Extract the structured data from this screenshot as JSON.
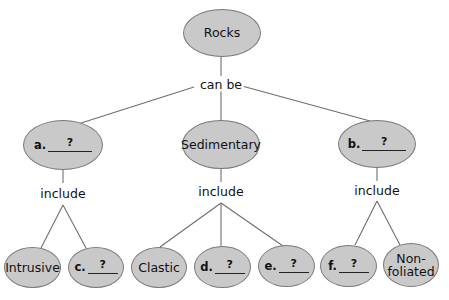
{
  "diagram": {
    "type": "concept-map",
    "root": {
      "label": "Rocks"
    },
    "root_link": "can be",
    "categories": [
      {
        "id": "a",
        "letter": "a.",
        "blank": "?",
        "link": "include",
        "children": [
          {
            "label": "Intrusive"
          },
          {
            "letter": "c.",
            "blank": "?"
          }
        ]
      },
      {
        "id": "sedimentary",
        "label": "Sedimentary",
        "link": "include",
        "children": [
          {
            "label": "Clastic"
          },
          {
            "letter": "d.",
            "blank": "?"
          },
          {
            "letter": "e.",
            "blank": "?"
          }
        ]
      },
      {
        "id": "b",
        "letter": "b.",
        "blank": "?",
        "link": "include",
        "children": [
          {
            "letter": "f.",
            "blank": "?"
          },
          {
            "label": "Non-\nfoliated"
          }
        ]
      }
    ],
    "colors": {
      "node_fill": "#c9c9c9",
      "node_stroke": "#7a7a7a",
      "line": "#6e6e6e",
      "text": "#111111"
    }
  }
}
